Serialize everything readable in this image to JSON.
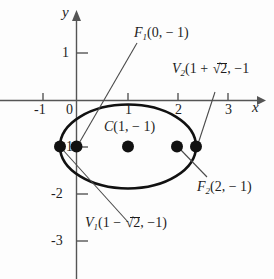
{
  "figure": {
    "type": "ellipse-conic-graph",
    "axes": {
      "x_label": "x",
      "y_label": "y",
      "x_ticks": [
        "-1",
        "0",
        "1",
        "2",
        "3"
      ],
      "y_ticks": [
        "1",
        "1",
        "-2",
        "-3"
      ],
      "y_tick_visible_labels": {
        "one": "1",
        "minus_one_partial": "1",
        "minus_two": "-2",
        "minus_three": "-3"
      },
      "x_range": [
        -1.6,
        3.7
      ],
      "y_range": [
        -3.5,
        1.7
      ]
    },
    "ellipse": {
      "center": [
        1,
        -1
      ],
      "semi_major_a": 1.414,
      "semi_minor_b": 1,
      "vertices": [
        [
          -0.414,
          -1
        ],
        [
          2.414,
          -1
        ]
      ],
      "foci": [
        [
          0,
          -1
        ],
        [
          2,
          -1
        ]
      ]
    },
    "points": [
      {
        "key": "V1",
        "label_text": "V₁(1 − √2, −1)",
        "name": "V",
        "sub": "1",
        "coords": "(1 − √2, −1)",
        "x": -0.414,
        "y": -1
      },
      {
        "key": "F1",
        "label_text": "F₁(0, − 1)",
        "name": "F",
        "sub": "1",
        "coords": "(0, − 1)",
        "x": 0,
        "y": -1
      },
      {
        "key": "C",
        "label_text": "C(1, − 1)",
        "name": "C",
        "sub": "",
        "coords": "(1, − 1)",
        "x": 1,
        "y": -1
      },
      {
        "key": "F2",
        "label_text": "F₂(2, − 1)",
        "name": "F",
        "sub": "2",
        "coords": "(2, − 1)",
        "x": 2,
        "y": -1
      },
      {
        "key": "V2",
        "label_text": "V₂(1 + √2, −1",
        "name": "V",
        "sub": "2",
        "coords": "(1 + √2, −1",
        "x": 2.414,
        "y": -1
      }
    ],
    "labels": {
      "F1_prefix": "F",
      "F1_sub": "1",
      "F1_rest": "(0, − 1)",
      "V2_prefix": "V",
      "V2_sub": "2",
      "V2_open": "(1 + ",
      "V2_radicand": "2",
      "V2_rest": ", −1",
      "C_text": "C",
      "C_rest": "(1, − 1)",
      "F2_prefix": "F",
      "F2_sub": "2",
      "F2_rest": "(2, − 1)",
      "V1_prefix": "V",
      "V1_sub": "1",
      "V1_open": "(1 − ",
      "V1_radicand": "2",
      "V1_rest": ", −1)"
    },
    "colors": {
      "curve": "#111111",
      "axis": "#555555",
      "dot": "#111111",
      "leader": "#4a4a4a",
      "background": "#fdfdfd"
    }
  }
}
